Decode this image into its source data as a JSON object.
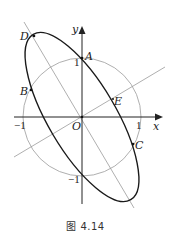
{
  "figure": {
    "caption": "图 4.14",
    "axes": {
      "x_label": "x",
      "y_label": "y",
      "origin_label": "O"
    },
    "ticks": {
      "x_pos": "1",
      "x_neg": "−1",
      "y_pos": "1",
      "y_neg": "−1"
    },
    "points": {
      "A": "A",
      "B": "B",
      "C": "C",
      "D": "D",
      "E": "E"
    },
    "colors": {
      "ellipse": "#1a1a1a",
      "circle": "#9a9a9a",
      "lines": "#9a9a9a",
      "axes": "#222222"
    }
  }
}
